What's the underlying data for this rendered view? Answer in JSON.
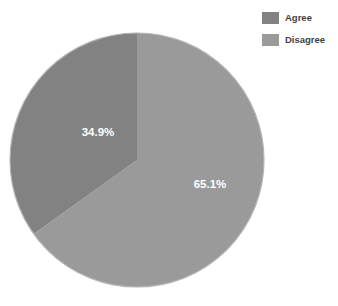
{
  "chart_data": {
    "type": "pie",
    "title": "",
    "subtitle": "",
    "xlabel": "",
    "ylabel": "",
    "grid": false,
    "legend_position": "top-right",
    "categories": [
      "Agree",
      "Disagree"
    ],
    "values": [
      34.9,
      65.1
    ],
    "value_unit": "%",
    "data_labels": [
      "34.9%",
      "65.1%"
    ],
    "colors": [
      "#828282",
      "#9a9a9a"
    ],
    "slices": [
      {
        "label": "Agree",
        "value": 34.9,
        "data_label": "34.9%",
        "color": "#828282",
        "start_angle_deg": 234.4,
        "end_angle_deg": 360.0,
        "label_x": 98,
        "label_y": 133
      },
      {
        "label": "Disagree",
        "value": 65.1,
        "data_label": "65.1%",
        "color": "#9a9a9a",
        "start_angle_deg": 0.0,
        "end_angle_deg": 234.4,
        "label_x": 210,
        "label_y": 185
      }
    ],
    "geometry": {
      "center_x": 137,
      "center_y": 160,
      "radius": 127
    },
    "outline_color": "#b5b5b5",
    "label_color": "#ffffff"
  },
  "legend": {
    "items": [
      {
        "label": "Agree",
        "color": "#828282"
      },
      {
        "label": "Disagree",
        "color": "#9a9a9a"
      }
    ]
  }
}
